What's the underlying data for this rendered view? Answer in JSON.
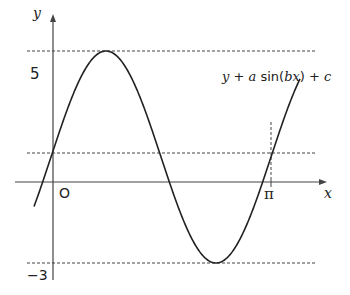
{
  "diagram": {
    "type": "sine-curve-graph",
    "curve_label": "y + a sin(bx) + c",
    "curve_label_parts": {
      "y": "y",
      "plus1": " + ",
      "a": "a",
      "sin": " sin(",
      "bx": "bx",
      "close": ") + ",
      "c": "c"
    },
    "axes": {
      "x_label": "x",
      "y_label": "y",
      "origin_label": "O",
      "x_tick_label": "π",
      "y_max_label": "5",
      "y_min_label": "−3"
    },
    "reference_lines": [
      {
        "name": "maximum",
        "value": 5,
        "style": "dashed"
      },
      {
        "name": "midline",
        "value": 1,
        "style": "dashed"
      },
      {
        "name": "minimum",
        "value": -3,
        "style": "dashed"
      },
      {
        "name": "x-equals-pi",
        "value": "π",
        "style": "dashed-vertical"
      }
    ],
    "colors": {
      "curve": "#222222",
      "axes": "#444444",
      "dashed": "#444444",
      "background": "#ffffff"
    }
  }
}
